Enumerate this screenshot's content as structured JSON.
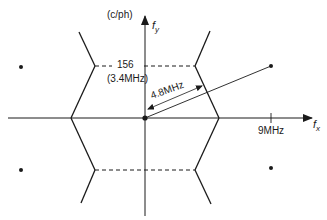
{
  "diagram": {
    "type": "2d-frequency-spectrum",
    "axes": {
      "x_label": "f",
      "x_subscript": "x",
      "y_label": "f",
      "y_subscript": "y",
      "y_unit": "(c/ph)"
    },
    "annotations": {
      "fy_value": "156",
      "fy_value_mhz": "(3.4MHz)",
      "diagonal_distance": "4.8MHz",
      "fx_tick": "9MHz"
    },
    "region_shape": "hexagon",
    "spectral_points": [
      "top-left",
      "top-right",
      "bottom-left",
      "bottom-right"
    ],
    "colors": {
      "ink": "#1a1a1a",
      "background": "#ffffff"
    }
  }
}
